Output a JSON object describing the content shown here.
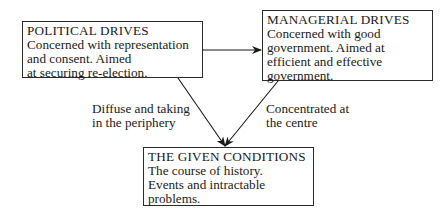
{
  "nodes": {
    "political": {
      "title": "POLITICAL DRIVES",
      "lines": [
        "Concerned with representation",
        "and consent. Aimed",
        "at securing re-election."
      ]
    },
    "managerial": {
      "title": "MANAGERIAL DRIVES",
      "lines": [
        "Concerned with good",
        "government. Aimed at",
        "efficient and effective",
        "government."
      ]
    },
    "conditions": {
      "title": "THE GIVEN CONDITIONS",
      "lines": [
        "The course of history.",
        "Events and intractable",
        "problems."
      ]
    }
  },
  "edges": {
    "left": {
      "lines": [
        "Diffuse and taking",
        "in the periphery"
      ]
    },
    "right": {
      "lines": [
        "Concentrated at",
        "the centre"
      ]
    }
  }
}
